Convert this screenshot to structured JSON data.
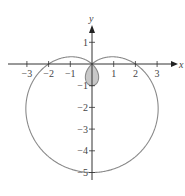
{
  "chart_data": {
    "type": "line",
    "title": "",
    "equation": "r = 2 - 3 sin θ",
    "curve": "limaçon with inner loop (shaded)",
    "xlabel": "x",
    "ylabel": "y",
    "xlim": [
      -3.5,
      3.8
    ],
    "ylim": [
      -5.3,
      1.8
    ],
    "x_ticks": [
      -3,
      -2,
      -1,
      1,
      2,
      3
    ],
    "y_ticks": [
      1,
      -1,
      -2,
      -3,
      -4,
      -5
    ],
    "x_tick_labels": [
      "−3",
      "−2",
      "−1",
      "1",
      "2",
      "3"
    ],
    "y_tick_labels": [
      "1",
      "−1",
      "−2",
      "−3",
      "−4",
      "−5"
    ],
    "grid": false,
    "legend": null,
    "key_points": [
      {
        "x": 2,
        "y": 0
      },
      {
        "x": -2,
        "y": 0
      },
      {
        "x": 0,
        "y": -5
      },
      {
        "x": 0,
        "y": -1
      },
      {
        "x": 0,
        "y": 0
      }
    ],
    "colors": {
      "curve": "#8a8a8a",
      "inner_loop_fill": "#c8c8c8",
      "axes": "#333333"
    }
  }
}
